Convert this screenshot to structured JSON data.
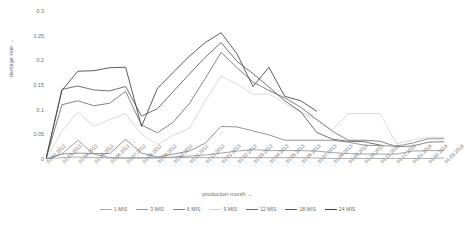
{
  "chart_data": {
    "type": "line",
    "title": "",
    "xlabel": "production month →",
    "ylabel": "damage rate →",
    "ylim": [
      0,
      0.3
    ],
    "yticks": [
      0,
      0.05,
      0.1,
      0.15,
      0.2,
      0.25,
      0.3
    ],
    "ytick_labels": [
      "0",
      "0.05",
      "0.1",
      "0.15",
      "0.2",
      "0.25",
      "0.3"
    ],
    "grid": false,
    "legend_position": "bottom",
    "categories": [
      "01.02.2012",
      "01.03.2012",
      "01.04.2012",
      "01.05.2012",
      "01.06.2012",
      "01.07.2012",
      "01.08.2012",
      "01.09.2012",
      "01.10.2012",
      "01.11.2012",
      "01.12.2012",
      "01.01.2013",
      "01.02.2013",
      "01.03.2013",
      "01.04.2013",
      "01.05.2013",
      "01.06.2013",
      "01.07.2013",
      "01.08.2013",
      "01.09.2013",
      "01.10.2013",
      "01.11.2013",
      "01.12.2013",
      "01.01.2014",
      "01.02.2014",
      "01.03.2014"
    ],
    "series": [
      {
        "name": "1 MIS",
        "color": "#a6a8ab",
        "values": [
          0.0,
          0.003,
          0.004,
          0.003,
          0.002,
          0.002,
          0.003,
          0.003,
          0.003,
          0.003,
          0.003,
          0.003,
          0.003,
          0.003,
          0.003,
          0.003,
          0.003,
          0.002,
          0.001,
          0.001,
          0.001,
          0.001,
          0.001,
          0.001,
          0.001,
          0.002
        ]
      },
      {
        "name": "3 MIS",
        "color": "#939598",
        "values": [
          0.0,
          0.01,
          0.038,
          0.01,
          0.003,
          0.002,
          0.002,
          0.002,
          0.004,
          0.006,
          0.008,
          0.012,
          0.016,
          0.019,
          0.017,
          0.017,
          0.017,
          0.016,
          0.013,
          0.011,
          0.01,
          0.01,
          0.01,
          0.016,
          0.017,
          0.017
        ]
      },
      {
        "name": "6 MIS",
        "color": "#808285",
        "values": [
          0.0,
          0.01,
          0.012,
          0.011,
          0.011,
          0.04,
          0.012,
          0.004,
          0.01,
          0.016,
          0.032,
          0.066,
          0.065,
          0.057,
          0.049,
          0.038,
          0.038,
          0.038,
          0.038,
          0.034,
          0.028,
          0.027,
          0.026,
          0.032,
          0.041,
          0.041
        ]
      },
      {
        "name": "9 MIS",
        "color": "#d1d3d4",
        "values": [
          0.0,
          0.056,
          0.096,
          0.066,
          0.08,
          0.092,
          0.05,
          0.03,
          0.048,
          0.062,
          0.118,
          0.168,
          0.152,
          0.131,
          0.132,
          0.113,
          0.095,
          0.08,
          0.06,
          0.092,
          0.092,
          0.092,
          0.031,
          0.038,
          0.044,
          0.044
        ]
      },
      {
        "name": "12 MIS",
        "color": "#6d6e71",
        "values": [
          0.0,
          0.11,
          0.118,
          0.108,
          0.113,
          0.137,
          0.069,
          0.053,
          0.075,
          0.112,
          0.163,
          0.216,
          0.185,
          0.156,
          0.139,
          0.124,
          0.105,
          0.08,
          0.056,
          0.038,
          0.038,
          0.036,
          0.025,
          0.026,
          0.034,
          0.035
        ]
      },
      {
        "name": "18 MIS",
        "color": "#58595b",
        "values": [
          0.0,
          0.141,
          0.148,
          0.14,
          0.138,
          0.147,
          0.087,
          0.102,
          0.137,
          0.172,
          0.206,
          0.236,
          0.198,
          0.173,
          0.146,
          0.118,
          0.096,
          0.054,
          0.04,
          0.036,
          0.035,
          0.028,
          null,
          null,
          null,
          null
        ]
      },
      {
        "name": "24 MIS",
        "color": "#414042",
        "values": [
          0.0,
          0.139,
          0.178,
          0.179,
          0.185,
          0.186,
          0.066,
          0.143,
          0.176,
          0.208,
          0.236,
          0.256,
          0.213,
          0.147,
          0.186,
          0.127,
          0.118,
          0.097,
          null,
          null,
          null,
          null,
          null,
          null,
          null,
          null
        ]
      }
    ]
  },
  "legend": {
    "items": [
      {
        "label": "1 MIS"
      },
      {
        "label": "3 MIS"
      },
      {
        "label": "6 MIS"
      },
      {
        "label": "9 MIS"
      },
      {
        "label": "12 MIS"
      },
      {
        "label": "18 MIS"
      },
      {
        "label": "24 MIS"
      }
    ]
  }
}
